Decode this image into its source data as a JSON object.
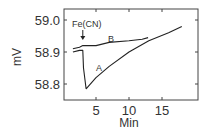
{
  "chart_data": {
    "type": "line",
    "title": "",
    "xlabel": "Min",
    "ylabel": "mV",
    "xlim": [
      0,
      20.5
    ],
    "ylim": [
      58.75,
      59.04
    ],
    "xticks": [
      5,
      10,
      15
    ],
    "xtick_labels": [
      "5",
      "10",
      "15"
    ],
    "yticks": [
      58.8,
      58.9,
      59.0
    ],
    "ytick_labels": [
      "58.8",
      "58.9",
      "59.0"
    ],
    "grid": false,
    "legend": null,
    "annotations": [
      {
        "text": "Fe(CN)",
        "x": 3.0,
        "y": 58.94,
        "arrow_to": [
          3.0,
          58.92
        ]
      },
      {
        "text": "A",
        "x": 5.0,
        "y": 58.84
      },
      {
        "text": "B",
        "x": 6.8,
        "y": 58.93
      }
    ],
    "series": [
      {
        "name": "A",
        "x": [
          1.5,
          2.5,
          3.0,
          3.1,
          3.5,
          5.0,
          7.0,
          10.0,
          13.0,
          16.0,
          18.0
        ],
        "y": [
          58.9,
          58.905,
          58.905,
          58.85,
          58.785,
          58.82,
          58.855,
          58.9,
          58.935,
          58.96,
          58.98
        ]
      },
      {
        "name": "B",
        "x": [
          1.5,
          2.5,
          3.0,
          5.0,
          7.0,
          10.0,
          12.0,
          12.9
        ],
        "y": [
          58.91,
          58.915,
          58.92,
          58.92,
          58.93,
          58.935,
          58.94,
          58.945
        ]
      }
    ]
  }
}
